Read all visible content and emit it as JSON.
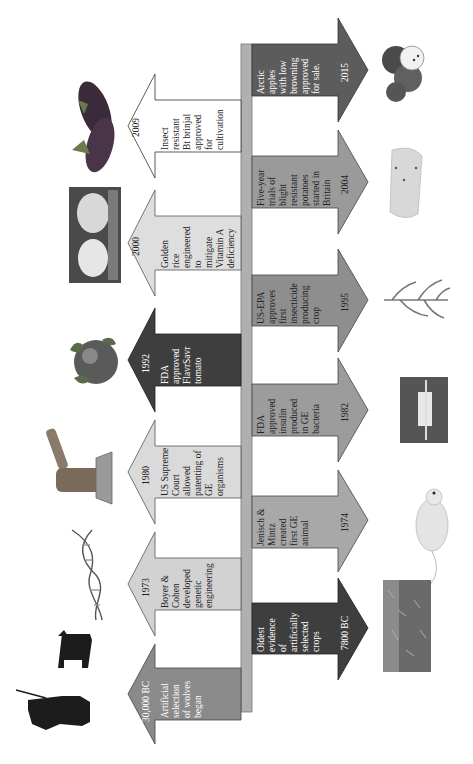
{
  "figure": {
    "orientation": "rotated 90 degrees counter-clockwise",
    "axis_color": "#b0b0b0"
  },
  "events_top": [
    {
      "year": "30,000 BC",
      "text": "Artificial\nselection\nof wolves\nbegan",
      "fill": "#8a8a8a",
      "text_color": "#ffffff",
      "image": "hunter-and-wolf-silhouette"
    },
    {
      "year": "1973",
      "text": "Boyer &\nCohen\ndeveloped\ngenetic\nengineering",
      "fill": "#d2d2d2",
      "text_color": "#222222",
      "image": "dna-double-helix"
    },
    {
      "year": "1980",
      "text": "US Supreme\nCourt\nallowed\npatenting of\nGE\norganisms",
      "fill": "#dadada",
      "text_color": "#222222",
      "image": "gavel"
    },
    {
      "year": "1992",
      "text": "FDA\napproved\nFlavrSavr\ntomato",
      "fill": "#3e3e3e",
      "text_color": "#ffffff",
      "image": "tomato"
    },
    {
      "year": "2000",
      "text": "Golden\nrice\nengineered\nto\nmitigate\nVitamin A\ndeficiency",
      "fill": "#dedede",
      "text_color": "#222222",
      "image": "golden-rice-in-hands"
    },
    {
      "year": "2009",
      "text": "Insect\nresistant\nBt brinjal\napproved\nfor\ncultivation",
      "fill": "#ffffff",
      "text_color": "#222222",
      "image": "brinjal-eggplant"
    }
  ],
  "events_bottom": [
    {
      "year": "7800 BC",
      "text": "Oldest\nevidence\nof\nartificially\nselected\ncrops",
      "fill": "#3e3e3e",
      "text_color": "#ffffff",
      "image": "wheat-field"
    },
    {
      "year": "1974",
      "text": "Jenisch &\nMintz\ncreated\nfirst GE\nanimal",
      "fill": "#a8a8a8",
      "text_color": "#222222",
      "image": "mouse"
    },
    {
      "year": "1982",
      "text": "FDA\napproved\ninsulin\nproduced\nin GE\nbacteria",
      "fill": "#9c9c9c",
      "text_color": "#222222",
      "image": "insulin-vial-and-syringe"
    },
    {
      "year": "1995",
      "text": "US-EPA\napproves\nfirst\ninsecticide\nproducing\ncrop",
      "fill": "#8e8e8e",
      "text_color": "#222222",
      "image": "corn-plant"
    },
    {
      "year": "2004",
      "text": "Five-year\ntrials of\nblight\nresistant\npotatoes\nstarted in\nBritain",
      "fill": "#9a9a9a",
      "text_color": "#222222",
      "image": "potato-slice"
    },
    {
      "year": "2015",
      "text": "Arctic\napples\nwith low\nbrowning\napproved\nfor sale.",
      "fill": "#5c5c5c",
      "text_color": "#ffffff",
      "image": "arctic-apples"
    }
  ]
}
